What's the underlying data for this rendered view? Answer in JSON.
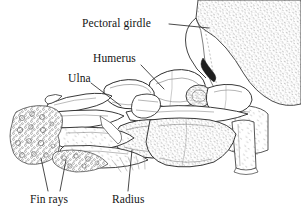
{
  "figure": {
    "kind": "anatomical-line-drawing",
    "background_color": "#ffffff",
    "ink_color": "#2a2a2a",
    "stipple_color": "#6e6e6e"
  },
  "labels": {
    "pectoral_girdle": "Pectoral girdle",
    "humerus": "Humerus",
    "ulna": "Ulna",
    "fin_rays": "Fin rays",
    "radius": "Radius"
  },
  "leader_lines": [
    {
      "name": "pectoral-girdle-leader",
      "from": [
        169,
        24
      ],
      "to": [
        209,
        28
      ]
    },
    {
      "name": "humerus-leader",
      "from": [
        141,
        65
      ],
      "to": [
        164,
        89
      ]
    },
    {
      "name": "ulna-leader",
      "from": [
        91,
        83
      ],
      "to": [
        121,
        106
      ]
    },
    {
      "name": "fin-rays-leader-a",
      "from": [
        48,
        191
      ],
      "to": [
        41,
        158
      ]
    },
    {
      "name": "fin-rays-leader-b",
      "from": [
        60,
        191
      ],
      "to": [
        66,
        160
      ]
    },
    {
      "name": "radius-leader",
      "from": [
        128,
        191
      ],
      "to": [
        132,
        150
      ]
    }
  ]
}
